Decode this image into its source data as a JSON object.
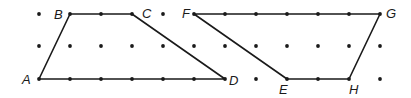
{
  "grid": {
    "x": [
      39,
      70,
      101,
      132,
      163,
      194,
      225,
      256,
      287,
      318,
      349,
      380
    ],
    "y": [
      14,
      46,
      79
    ],
    "dot_color": "#1a1a1a"
  },
  "shapes": [
    {
      "name": "trapezoid-ABCD",
      "points": [
        [
          39,
          79
        ],
        [
          70,
          14
        ],
        [
          132,
          14
        ],
        [
          225,
          79
        ]
      ],
      "vertices": [
        {
          "label": "A",
          "x": 39,
          "y": 79,
          "lx": 22,
          "ly": 84
        },
        {
          "label": "B",
          "x": 70,
          "y": 14,
          "lx": 54,
          "ly": 19
        },
        {
          "label": "C",
          "x": 132,
          "y": 14,
          "lx": 142,
          "ly": 18
        },
        {
          "label": "D",
          "x": 225,
          "y": 79,
          "lx": 229,
          "ly": 85
        }
      ]
    },
    {
      "name": "parallelogram-FGHE",
      "points": [
        [
          194,
          14
        ],
        [
          380,
          14
        ],
        [
          349,
          79
        ],
        [
          287,
          79
        ]
      ],
      "vertices": [
        {
          "label": "F",
          "x": 194,
          "y": 14,
          "lx": 182,
          "ly": 18
        },
        {
          "label": "G",
          "x": 380,
          "y": 14,
          "lx": 386,
          "ly": 18
        },
        {
          "label": "H",
          "x": 349,
          "y": 79,
          "lx": 349,
          "ly": 94
        },
        {
          "label": "E",
          "x": 287,
          "y": 79,
          "lx": 279,
          "ly": 94
        }
      ]
    }
  ],
  "line_color": "#1a1a1a"
}
